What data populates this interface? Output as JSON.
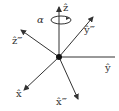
{
  "diagram": {
    "colors": {
      "axis": "#333333",
      "background": "#ffffff"
    },
    "origin": {
      "x": 59,
      "y": 57
    },
    "axes": [
      {
        "id": "z",
        "label": "ẑ",
        "end": [
          59,
          7
        ]
      },
      {
        "id": "y",
        "label": "ŷ",
        "end": [
          115,
          57
        ]
      },
      {
        "id": "x",
        "label": "x̂",
        "end": [
          24,
          90
        ]
      },
      {
        "id": "x3",
        "label": "x̂‴",
        "end": [
          78,
          99
        ]
      },
      {
        "id": "y3",
        "label": "ŷ‴",
        "end": [
          93,
          17
        ]
      },
      {
        "id": "z3",
        "label": "ẑ‴",
        "end": [
          21,
          30
        ]
      }
    ],
    "rotation": {
      "label": "α",
      "about": "z"
    }
  }
}
